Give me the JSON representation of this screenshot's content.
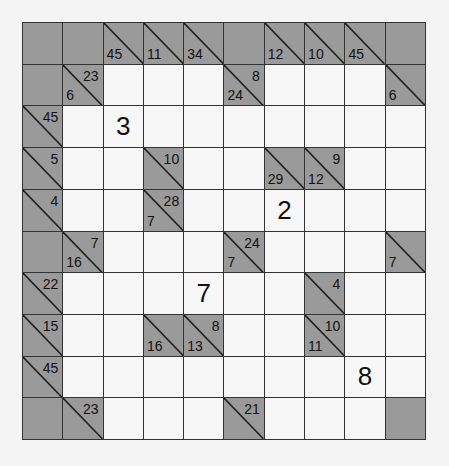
{
  "puzzle": {
    "type": "kakuro",
    "rows": 10,
    "cols": 10,
    "colors": {
      "block": "#9a9a9a",
      "white": "#f7f7f7",
      "line": "#333333"
    },
    "grid": [
      [
        {
          "t": "B"
        },
        {
          "t": "B"
        },
        {
          "t": "C",
          "d": "45"
        },
        {
          "t": "C",
          "d": "11"
        },
        {
          "t": "C",
          "d": "34"
        },
        {
          "t": "B"
        },
        {
          "t": "C",
          "d": "12"
        },
        {
          "t": "C",
          "d": "10"
        },
        {
          "t": "C",
          "d": "45"
        },
        {
          "t": "B"
        }
      ],
      [
        {
          "t": "B"
        },
        {
          "t": "C",
          "d": "6",
          "r": "23"
        },
        {
          "t": "W"
        },
        {
          "t": "W"
        },
        {
          "t": "W"
        },
        {
          "t": "C",
          "d": "24",
          "r": "8"
        },
        {
          "t": "W"
        },
        {
          "t": "W"
        },
        {
          "t": "W"
        },
        {
          "t": "C",
          "d": "6"
        }
      ],
      [
        {
          "t": "C",
          "r": "45"
        },
        {
          "t": "W"
        },
        {
          "t": "W",
          "v": "3"
        },
        {
          "t": "W"
        },
        {
          "t": "W"
        },
        {
          "t": "W"
        },
        {
          "t": "W"
        },
        {
          "t": "W"
        },
        {
          "t": "W"
        },
        {
          "t": "W"
        }
      ],
      [
        {
          "t": "C",
          "r": "5"
        },
        {
          "t": "W"
        },
        {
          "t": "W"
        },
        {
          "t": "C",
          "r": "10"
        },
        {
          "t": "W"
        },
        {
          "t": "W"
        },
        {
          "t": "C",
          "d": "29"
        },
        {
          "t": "C",
          "d": "12",
          "r": "9"
        },
        {
          "t": "W"
        },
        {
          "t": "W"
        }
      ],
      [
        {
          "t": "C",
          "r": "4"
        },
        {
          "t": "W"
        },
        {
          "t": "W"
        },
        {
          "t": "C",
          "d": "7",
          "r": "28"
        },
        {
          "t": "W"
        },
        {
          "t": "W"
        },
        {
          "t": "W",
          "v": "2"
        },
        {
          "t": "W"
        },
        {
          "t": "W"
        },
        {
          "t": "W"
        }
      ],
      [
        {
          "t": "B"
        },
        {
          "t": "C",
          "d": "16",
          "r": "7"
        },
        {
          "t": "W"
        },
        {
          "t": "W"
        },
        {
          "t": "W"
        },
        {
          "t": "C",
          "d": "7",
          "r": "24"
        },
        {
          "t": "W"
        },
        {
          "t": "W"
        },
        {
          "t": "W"
        },
        {
          "t": "C",
          "d": "7"
        }
      ],
      [
        {
          "t": "C",
          "r": "22"
        },
        {
          "t": "W"
        },
        {
          "t": "W"
        },
        {
          "t": "W"
        },
        {
          "t": "W",
          "v": "7"
        },
        {
          "t": "W"
        },
        {
          "t": "W"
        },
        {
          "t": "C",
          "r": "4"
        },
        {
          "t": "W"
        },
        {
          "t": "W"
        }
      ],
      [
        {
          "t": "C",
          "r": "15"
        },
        {
          "t": "W"
        },
        {
          "t": "W"
        },
        {
          "t": "C",
          "d": "16"
        },
        {
          "t": "C",
          "d": "13",
          "r": "8"
        },
        {
          "t": "W"
        },
        {
          "t": "W"
        },
        {
          "t": "C",
          "d": "11",
          "r": "10"
        },
        {
          "t": "W"
        },
        {
          "t": "W"
        }
      ],
      [
        {
          "t": "C",
          "r": "45"
        },
        {
          "t": "W"
        },
        {
          "t": "W"
        },
        {
          "t": "W"
        },
        {
          "t": "W"
        },
        {
          "t": "W"
        },
        {
          "t": "W"
        },
        {
          "t": "W"
        },
        {
          "t": "W",
          "v": "8"
        },
        {
          "t": "W"
        }
      ],
      [
        {
          "t": "B"
        },
        {
          "t": "C",
          "r": "23"
        },
        {
          "t": "W"
        },
        {
          "t": "W"
        },
        {
          "t": "W"
        },
        {
          "t": "C",
          "r": "21"
        },
        {
          "t": "W"
        },
        {
          "t": "W"
        },
        {
          "t": "W"
        },
        {
          "t": "B"
        }
      ]
    ]
  }
}
